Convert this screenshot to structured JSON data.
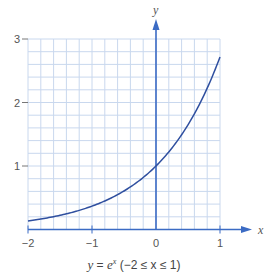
{
  "chart_data": {
    "type": "line",
    "title": "",
    "caption": "y = e^x (−2 ≤ x ≤ 1)",
    "caption_parts": {
      "lhs": "y",
      "eq": " = ",
      "base": "e",
      "exp": "x",
      "domain": " (−2 ≤ x ≤ 1)"
    },
    "xlabel": "x",
    "ylabel": "y",
    "xlim": [
      -2,
      1
    ],
    "ylim": [
      0,
      3
    ],
    "xticks": [
      -2,
      -1,
      0,
      1
    ],
    "xtick_labels": [
      "−2",
      "−1",
      "0",
      "1"
    ],
    "yticks": [
      1,
      2,
      3
    ],
    "ytick_labels": [
      "1",
      "2",
      "3"
    ],
    "grid": {
      "on": true,
      "minor_step": 0.2
    },
    "series": [
      {
        "name": "y = e^x",
        "function": "exp",
        "x": [
          -2,
          -1.5,
          -1,
          -0.5,
          0,
          0.5,
          1
        ],
        "values": [
          0.135,
          0.223,
          0.368,
          0.607,
          1.0,
          1.649,
          2.718
        ]
      }
    ],
    "colors": {
      "curve": "#2f4f9f",
      "axis": "#3b6bc4",
      "grid": "#c9d8ee",
      "text": "#555555"
    }
  }
}
